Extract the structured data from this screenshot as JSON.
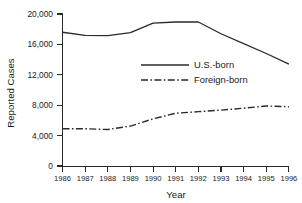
{
  "chart_data": {
    "type": "line",
    "title": "",
    "xlabel": "Year",
    "ylabel": "Reported Cases",
    "x": [
      1986,
      1987,
      1988,
      1989,
      1990,
      1991,
      1992,
      1993,
      1994,
      1995,
      1996
    ],
    "categories": [
      "1986",
      "1987",
      "1988",
      "1989",
      "1990",
      "1991",
      "1992",
      "1993",
      "1994",
      "1995",
      "1996"
    ],
    "xlim": [
      1986,
      1996
    ],
    "ylim": [
      0,
      20000
    ],
    "yticks": [
      0,
      4000,
      8000,
      12000,
      16000,
      20000
    ],
    "ytick_labels": [
      "0",
      "4,000",
      "8,000",
      "12,000",
      "16,000",
      "20,000"
    ],
    "xtick_labels": [
      "1986",
      "1987",
      "1988",
      "1989",
      "1990",
      "1991",
      "1992",
      "1993",
      "1994",
      "1995",
      "1996"
    ],
    "grid": false,
    "legend_position": "center-right-inside",
    "series": [
      {
        "name": "U.S.-born",
        "linestyle": "solid",
        "color": "#2a2a2a",
        "values": [
          17600,
          17200,
          17150,
          17550,
          18800,
          18950,
          18950,
          17400,
          16100,
          14800,
          13400
        ]
      },
      {
        "name": "Foreign-born",
        "linestyle": "dash-dot",
        "color": "#2a2a2a",
        "values": [
          4900,
          4900,
          4800,
          5250,
          6200,
          6950,
          7150,
          7350,
          7600,
          7900,
          7800
        ]
      }
    ]
  },
  "axis": {
    "y_title": "Reported Cases",
    "x_title": "Year"
  },
  "legend": {
    "entries": [
      {
        "label": "U.S.-born",
        "style": "solid"
      },
      {
        "label": "Foreign-born",
        "style": "dash-dot"
      }
    ]
  },
  "colors": {
    "ink": "#2a2a2a",
    "background": "#ffffff"
  }
}
